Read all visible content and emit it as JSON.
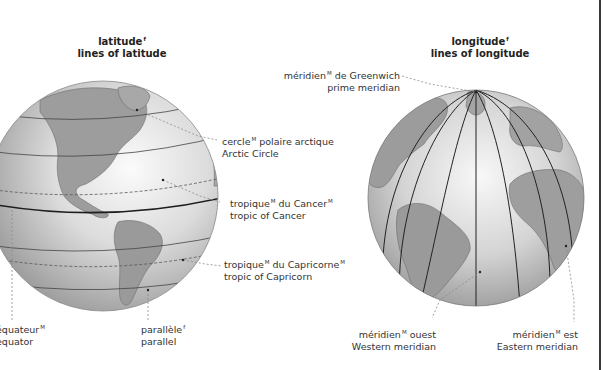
{
  "latitude_panel": {
    "title_fr": "latitude",
    "title_fr_gender": "f",
    "title_en": "lines of latitude",
    "labels": [
      {
        "fr": "cercle",
        "gender": "M",
        "fr_rest": " polaire arctique",
        "en": "Arctic Circle"
      },
      {
        "fr": "tropique",
        "gender": "M",
        "fr_rest": " du Cancer",
        "fr_rest_gender": "M",
        "en": "tropic of Cancer"
      },
      {
        "fr": "tropique",
        "gender": "M",
        "fr_rest": " du Capricorne",
        "fr_rest_gender": "M",
        "en": "tropic of Capricorn"
      },
      {
        "fr": "équateur",
        "gender": "M",
        "en": "equator"
      },
      {
        "fr": "parallèle",
        "gender": "f",
        "en": "parallel"
      }
    ]
  },
  "longitude_panel": {
    "title_fr": "longitude",
    "title_fr_gender": "f",
    "title_en": "lines of longitude",
    "labels": [
      {
        "fr": "méridien",
        "gender": "M",
        "fr_rest": " de Greenwich",
        "en": "prime meridian"
      },
      {
        "fr": "méridien",
        "gender": "M",
        "fr_rest": " ouest",
        "en": "Western meridian"
      },
      {
        "fr": "méridien",
        "gender": "M",
        "fr_rest": " est",
        "en": "Eastern meridian"
      }
    ]
  },
  "colors": {
    "globe_light": "#f4f4f4",
    "globe_mid": "#c8c8c8",
    "globe_dark": "#8c8c8c",
    "land": "#9a9a9a",
    "line": "#2b2b2b",
    "leader": "#8a8a8a"
  }
}
